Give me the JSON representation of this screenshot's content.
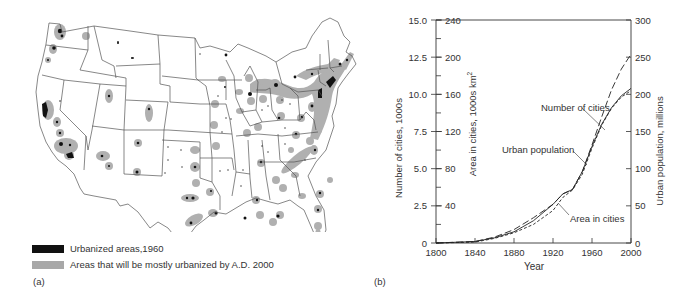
{
  "figure": {
    "panel_a_label": "(a)",
    "panel_b_label": "(b)"
  },
  "map": {
    "title": "",
    "legend": [
      {
        "label": "Urbanized areas,1960",
        "color": "#111111"
      },
      {
        "label": "Areas that will be mostly urbanized by A.D. 2000",
        "color": "#a8a8a8"
      }
    ]
  },
  "chart_data": {
    "type": "line",
    "title": "",
    "xlabel": "Year",
    "x_ticks": [
      "1800",
      "1840",
      "1880",
      "1920",
      "1960",
      "2000"
    ],
    "xlim": [
      1800,
      2000
    ],
    "y_axes": [
      {
        "label": "Number of cities, 1000s",
        "position": "left-outer",
        "ticks": [
          "0",
          "2.5",
          "5.0",
          "7.5",
          "10.0",
          "12.5",
          "15.0"
        ],
        "ylim": [
          0,
          15
        ]
      },
      {
        "label": "Area in cities, 1000s km²",
        "position": "left-inner",
        "ticks": [
          "40",
          "80",
          "120",
          "160",
          "200",
          "240"
        ],
        "ylim": [
          0,
          240
        ]
      },
      {
        "label": "Urban population, millions",
        "position": "right",
        "ticks": [
          "0",
          "50",
          "100",
          "150",
          "200",
          "250",
          "300"
        ],
        "ylim": [
          0,
          300
        ]
      }
    ],
    "grid": false,
    "annotations": [
      "Number of cities",
      "Urban population",
      "Area in cities"
    ],
    "x": [
      1800,
      1840,
      1860,
      1880,
      1900,
      1920,
      1930,
      1940,
      1950,
      1960,
      1970,
      1980,
      1990,
      2000
    ],
    "series": [
      {
        "name": "Number of cities",
        "axis": "Number of cities, 1000s",
        "style": "long-dash",
        "values": [
          0.0,
          0.1,
          0.4,
          0.9,
          1.7,
          2.6,
          3.3,
          3.6,
          4.8,
          6.6,
          8.5,
          10.3,
          11.7,
          12.7
        ]
      },
      {
        "name": "Urban population",
        "axis": "Urban population, millions",
        "style": "solid",
        "values": [
          0,
          2,
          7,
          15,
          30,
          52,
          66,
          72,
          96,
          130,
          160,
          182,
          198,
          208
        ]
      },
      {
        "name": "Area in cities",
        "axis": "Area in cities, 1000s km²",
        "style": "short-dash",
        "values": [
          0,
          1,
          5,
          11,
          20,
          35,
          49,
          57,
          74,
          102,
          127,
          145,
          157,
          164
        ]
      }
    ]
  }
}
